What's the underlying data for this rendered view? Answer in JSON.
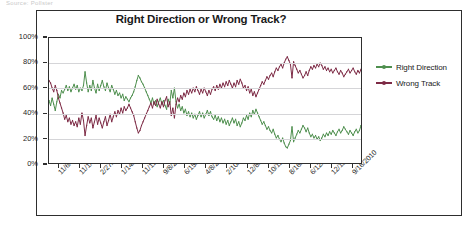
{
  "page": {
    "top_sliver_text": "Source: Pollster"
  },
  "chart_data": {
    "type": "line",
    "title": "Right Direction or Wrong Track?",
    "xlabel": "",
    "ylabel": "",
    "ylim": [
      0,
      100
    ],
    "ytick_labels": [
      "100%",
      "80%",
      "60%",
      "40%",
      "20%",
      "0%"
    ],
    "ytick_values": [
      100,
      80,
      60,
      40,
      20,
      0
    ],
    "grid": true,
    "legend_position": "right",
    "xtick_labels": [
      "11/6/1994",
      "11/1/1998",
      "2/27/2000",
      "1/14/2001",
      "11/11/2001",
      "9/8/2002",
      "6/15/2003",
      "4/8/2004",
      "2/10/2005",
      "12/8/2005",
      "10/12/2006",
      "8/16/2007",
      "6/12/2008",
      "12/13/2009",
      "9/16/2010"
    ],
    "series": [
      {
        "name": "Right Direction",
        "color": "#4e8f4e",
        "values": [
          50,
          46,
          52,
          47,
          42,
          49,
          55,
          52,
          58,
          56,
          59,
          62,
          58,
          61,
          57,
          60,
          63,
          59,
          62,
          57,
          60,
          58,
          62,
          73,
          64,
          57,
          62,
          58,
          66,
          60,
          56,
          63,
          58,
          62,
          66,
          61,
          58,
          64,
          60,
          57,
          62,
          59,
          55,
          58,
          54,
          56,
          52,
          55,
          50,
          53,
          51,
          49,
          52,
          54,
          57,
          61,
          66,
          70,
          68,
          65,
          63,
          60,
          57,
          54,
          51,
          48,
          52,
          47,
          50,
          45,
          49,
          52,
          47,
          50,
          46,
          43,
          51,
          47,
          58,
          52,
          60,
          49,
          44,
          47,
          42,
          45,
          40,
          43,
          38,
          41,
          37,
          40,
          36,
          39,
          35,
          38,
          41,
          37,
          40,
          36,
          39,
          42,
          38,
          41,
          37,
          35,
          38,
          34,
          37,
          33,
          36,
          32,
          35,
          31,
          34,
          30,
          33,
          36,
          32,
          35,
          30,
          33,
          29,
          32,
          36,
          34,
          38,
          35,
          40,
          37,
          42,
          39,
          43,
          40,
          37,
          34,
          31,
          33,
          30,
          27,
          29,
          26,
          24,
          27,
          23,
          20,
          22,
          19,
          17,
          20,
          16,
          13,
          12,
          15,
          18,
          29,
          17,
          20,
          23,
          26,
          24,
          27,
          30,
          28,
          25,
          28,
          24,
          21,
          23,
          20,
          22,
          19,
          21,
          18,
          20,
          23,
          21,
          24,
          22,
          25,
          23,
          26,
          24,
          22,
          25,
          27,
          24,
          26,
          29,
          27,
          25,
          23,
          26,
          24,
          22,
          25,
          27,
          24,
          26,
          30
        ]
      },
      {
        "name": "Wrong Track",
        "color": "#7d2a45",
        "values": [
          66,
          64,
          60,
          57,
          62,
          58,
          52,
          48,
          44,
          40,
          35,
          38,
          33,
          36,
          31,
          34,
          30,
          33,
          29,
          36,
          31,
          40,
          34,
          22,
          30,
          37,
          32,
          36,
          28,
          33,
          38,
          31,
          36,
          32,
          28,
          33,
          37,
          30,
          34,
          39,
          33,
          37,
          41,
          37,
          42,
          39,
          44,
          40,
          45,
          42,
          44,
          47,
          44,
          41,
          38,
          33,
          28,
          24,
          26,
          30,
          33,
          36,
          39,
          42,
          45,
          48,
          44,
          49,
          46,
          51,
          47,
          44,
          49,
          45,
          50,
          53,
          45,
          49,
          38,
          44,
          36,
          47,
          52,
          49,
          54,
          51,
          56,
          53,
          58,
          55,
          59,
          56,
          60,
          57,
          61,
          58,
          55,
          59,
          56,
          60,
          57,
          54,
          58,
          55,
          59,
          61,
          58,
          62,
          59,
          63,
          60,
          64,
          61,
          65,
          62,
          66,
          63,
          60,
          64,
          61,
          66,
          63,
          67,
          64,
          60,
          62,
          58,
          61,
          56,
          59,
          54,
          57,
          53,
          56,
          59,
          62,
          65,
          63,
          66,
          69,
          67,
          70,
          72,
          69,
          73,
          76,
          74,
          77,
          79,
          76,
          80,
          83,
          85,
          82,
          79,
          68,
          81,
          78,
          75,
          72,
          74,
          71,
          68,
          70,
          73,
          70,
          74,
          77,
          75,
          78,
          76,
          79,
          77,
          80,
          78,
          75,
          77,
          74,
          76,
          73,
          75,
          72,
          74,
          76,
          73,
          71,
          74,
          72,
          69,
          71,
          73,
          75,
          72,
          74,
          76,
          73,
          71,
          74,
          72,
          75
        ]
      }
    ]
  },
  "legend": {
    "items": [
      {
        "label": "Right Direction",
        "color": "#4e8f4e"
      },
      {
        "label": "Wrong Track",
        "color": "#7d2a45"
      }
    ]
  }
}
